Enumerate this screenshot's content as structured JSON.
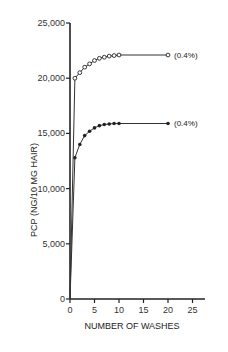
{
  "chart_data": {
    "type": "line",
    "title": "",
    "xlabel": "NUMBER OF WASHES",
    "ylabel": "PCP (NG/10 MG HAIR)",
    "xlim": [
      0,
      25
    ],
    "ylim": [
      0,
      25000
    ],
    "x_ticks": [
      0,
      5,
      10,
      15,
      20,
      25
    ],
    "x_tick_labels": [
      "0",
      "5",
      "10",
      "15",
      "20",
      "25"
    ],
    "y_ticks": [
      0,
      5000,
      10000,
      15000,
      20000,
      25000
    ],
    "y_tick_labels": [
      "0",
      "5,000",
      "10,000",
      "15,000",
      "20,000",
      "25,000"
    ],
    "grid": false,
    "legend": null,
    "series": [
      {
        "name": "open-circle series",
        "marker": "open-circle",
        "annotation": "(0.4%)",
        "x": [
          0,
          1,
          2,
          3,
          4,
          5,
          6,
          7,
          8,
          9,
          10,
          20
        ],
        "values": [
          0,
          20000,
          20500,
          21000,
          21300,
          21600,
          21800,
          21900,
          22000,
          22050,
          22100,
          22100
        ]
      },
      {
        "name": "filled-circle series",
        "marker": "filled-circle",
        "annotation": "(0.4%)",
        "x": [
          0,
          1,
          2,
          3,
          4,
          5,
          6,
          7,
          8,
          9,
          10,
          20
        ],
        "values": [
          0,
          12800,
          14000,
          14800,
          15200,
          15500,
          15700,
          15800,
          15850,
          15900,
          15900,
          15900
        ]
      }
    ]
  }
}
